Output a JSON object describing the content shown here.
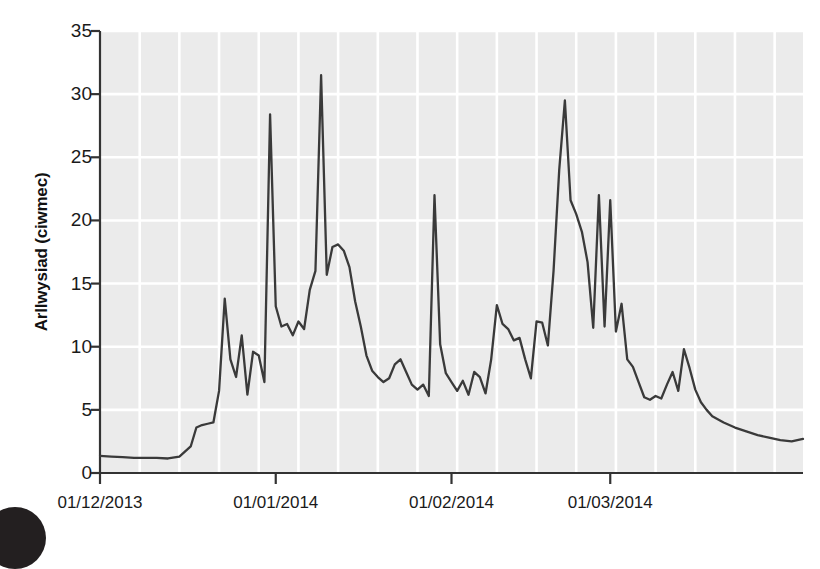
{
  "chart_data": {
    "type": "line",
    "title": "",
    "subtitle": "",
    "xlabel": "",
    "ylabel": "Arllwysiad (ciwmec)",
    "ylim": [
      0,
      35
    ],
    "y_ticks": [
      0,
      5,
      10,
      15,
      20,
      25,
      30,
      35
    ],
    "x_tick_labels": [
      "01/12/2013",
      "01/01/2014",
      "01/02/2014",
      "01/03/2014"
    ],
    "x_tick_dates": [
      "2013-12-01",
      "2014-01-01",
      "2014-02-01",
      "2014-03-01"
    ],
    "xlim": [
      "2013-12-01",
      "2014-04-03"
    ],
    "grid": true,
    "grid_color": "#ffffff",
    "plot_background": "#ebebeb",
    "line_color": "#3a3a3a",
    "line_width": 2.3,
    "legend": null,
    "legend_position": "none",
    "series": [
      {
        "name": "Arllwysiad",
        "x_days_from_start": [
          0,
          2,
          4,
          6,
          8,
          10,
          12,
          14,
          16,
          17,
          18,
          19,
          20,
          21,
          22,
          23,
          24,
          25,
          26,
          27,
          28,
          29,
          30,
          31,
          32,
          33,
          34,
          35,
          36,
          37,
          38,
          39,
          40,
          41,
          42,
          43,
          44,
          45,
          46,
          47,
          48,
          49,
          50,
          51,
          52,
          53,
          54,
          55,
          56,
          57,
          58,
          59,
          60,
          61,
          62,
          63,
          64,
          65,
          66,
          67,
          68,
          69,
          70,
          71,
          72,
          73,
          74,
          75,
          76,
          77,
          78,
          79,
          80,
          81,
          82,
          83,
          84,
          85,
          86,
          87,
          88,
          89,
          90,
          91,
          92,
          93,
          94,
          95,
          96,
          97,
          98,
          99,
          100,
          101,
          102,
          103,
          104,
          105,
          106,
          107,
          108,
          110,
          112,
          114,
          116,
          118,
          120,
          122,
          124
        ],
        "values": [
          1.35,
          1.3,
          1.25,
          1.2,
          1.2,
          1.2,
          1.15,
          1.3,
          2.1,
          3.6,
          3.8,
          3.9,
          4.0,
          6.5,
          13.8,
          9.0,
          7.6,
          10.9,
          6.2,
          9.6,
          9.3,
          7.2,
          28.4,
          13.2,
          11.6,
          11.8,
          10.9,
          12.0,
          11.4,
          14.5,
          16.0,
          31.5,
          15.7,
          17.9,
          18.1,
          17.6,
          16.3,
          13.6,
          11.6,
          9.3,
          8.1,
          7.6,
          7.2,
          7.5,
          8.6,
          9.0,
          8.0,
          7.0,
          6.6,
          7.0,
          6.1,
          22.0,
          10.2,
          7.9,
          7.2,
          6.5,
          7.3,
          6.2,
          8.0,
          7.6,
          6.3,
          9.0,
          13.3,
          11.8,
          11.4,
          10.5,
          10.7,
          9.0,
          7.5,
          12.0,
          11.9,
          10.1,
          16.0,
          24.0,
          29.5,
          21.6,
          20.5,
          19.1,
          16.7,
          11.5,
          22.0,
          11.6,
          21.6,
          11.2,
          13.4,
          9.0,
          8.4,
          7.2,
          6.0,
          5.8,
          6.1,
          5.9,
          7.0,
          8.0,
          6.5,
          9.8,
          8.3,
          6.6,
          5.6,
          5.0,
          4.5,
          4.0,
          3.6,
          3.3,
          3.0,
          2.8,
          2.6,
          2.5,
          2.7,
          2.6,
          2.3,
          2.2,
          2.7,
          2.1
        ]
      }
    ],
    "peaks": [
      {
        "label": "peak-1",
        "value": 28.4
      },
      {
        "label": "peak-2",
        "value": 31.5
      },
      {
        "label": "peak-3",
        "value": 22.0
      },
      {
        "label": "peak-4",
        "value": 29.5
      },
      {
        "label": "peak-5",
        "value": 22.0
      },
      {
        "label": "peak-6",
        "value": 21.6
      },
      {
        "label": "peak-7",
        "value": 9.8
      }
    ]
  },
  "axes": {
    "y_title": "Arllwysiad (ciwmec)",
    "y_ticks": [
      "0",
      "5",
      "10",
      "15",
      "20",
      "25",
      "30",
      "35"
    ],
    "x_ticks": [
      "01/12/2013",
      "01/01/2014",
      "01/02/2014",
      "01/03/2014"
    ]
  }
}
